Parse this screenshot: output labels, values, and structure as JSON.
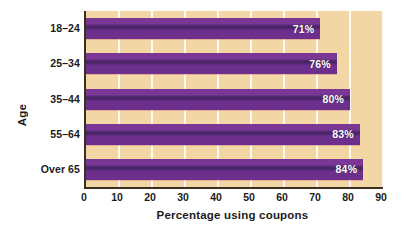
{
  "chart_data": {
    "type": "bar",
    "orientation": "horizontal",
    "title": "",
    "xlabel": "Percentage using coupons",
    "ylabel": "Age",
    "categories": [
      "18–24",
      "25–34",
      "35–44",
      "55–64",
      "Over 65"
    ],
    "values": [
      71,
      76,
      80,
      83,
      84
    ],
    "value_labels": [
      "71%",
      "76%",
      "80%",
      "83%",
      "84%"
    ],
    "xlim": [
      0,
      90
    ],
    "xticks": [
      0,
      10,
      20,
      30,
      40,
      50,
      60,
      70,
      80,
      90
    ],
    "xtick_labels": [
      "0",
      "10",
      "20",
      "30",
      "40",
      "50",
      "60",
      "70",
      "80",
      "90"
    ],
    "grid": true,
    "grid_axis": "x",
    "legend": false,
    "legend_position": "none",
    "colors": {
      "bar": "#6d2f8c",
      "bar_highlight": "#7a3796",
      "bar_shadow": "#4a2568",
      "plot_background": "#f2d7a4",
      "gridline": "#ffffff",
      "axis": "#3a3020",
      "text": "#1b1b1b",
      "value_label": "#ffffff",
      "figure_background": "#ffffff"
    }
  }
}
